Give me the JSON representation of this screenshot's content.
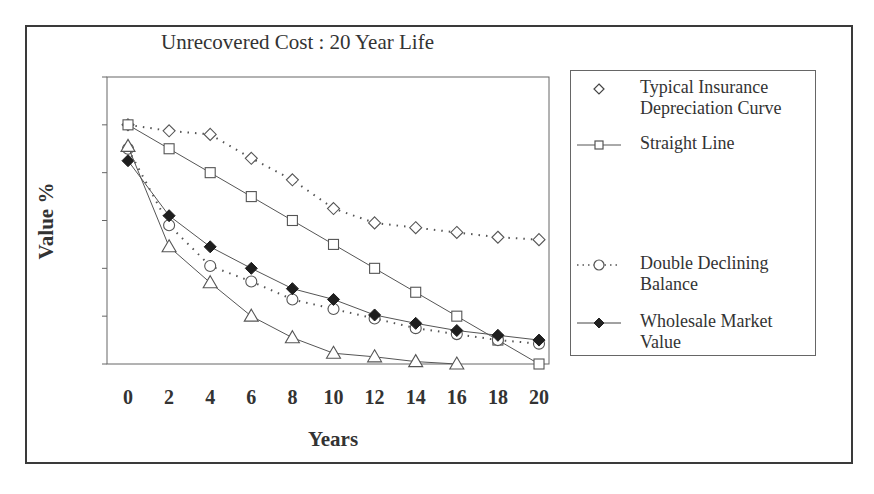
{
  "chart_data": {
    "type": "line",
    "title": "Unrecovered Cost : 20 Year Life",
    "xlabel": "Years",
    "ylabel": "Value %",
    "x": [
      0,
      2,
      4,
      6,
      8,
      10,
      12,
      14,
      16,
      18,
      20
    ],
    "xticks": [
      "0",
      "2",
      "4",
      "6",
      "8",
      "10",
      "12",
      "14",
      "16",
      "18",
      "20"
    ],
    "ylim": [
      0,
      120
    ],
    "ytick_count": 7,
    "ytick_labels_visible": false,
    "grid": false,
    "legend_position": "right",
    "series": [
      {
        "name": "Typical Insurance Depreciation Curve",
        "marker": "open-diamond",
        "line": "dotted",
        "values": [
          100,
          97.5,
          96,
          86,
          77,
          65,
          59,
          57,
          55,
          53,
          52
        ]
      },
      {
        "name": "Straight Line",
        "marker": "open-square",
        "line": "solid",
        "values": [
          100,
          90,
          80,
          70,
          60,
          50,
          40,
          30,
          20,
          10,
          0
        ]
      },
      {
        "name": "Double Declining Balance",
        "marker": "open-circle",
        "line": "dotted",
        "values": [
          90,
          58,
          41,
          34.5,
          27,
          23,
          19,
          15,
          12.5,
          10,
          8.5
        ]
      },
      {
        "name": "Wholesale Market Value",
        "marker": "filled-diamond",
        "line": "solid",
        "values": [
          85,
          62,
          49,
          40,
          31.5,
          27,
          20.5,
          17,
          14,
          12,
          10
        ]
      },
      {
        "name": "",
        "marker": "open-triangle",
        "line": "solid",
        "legend": false,
        "values": [
          91,
          49,
          34,
          20,
          11,
          4.5,
          3,
          1,
          0,
          null,
          null
        ]
      }
    ]
  },
  "legend": {
    "items": [
      {
        "label": "Typical Insurance Depreciation Curve",
        "icon": "open-diamond-icon"
      },
      {
        "label": "Straight Line",
        "icon": "open-square-line-icon"
      },
      {
        "label": "Double Declining Balance",
        "icon": "open-circle-dotted-icon"
      },
      {
        "label": "Wholesale Market Value",
        "icon": "filled-diamond-line-icon"
      }
    ]
  },
  "colors": {
    "ink": "#333333",
    "frame": "#3a3a3a",
    "background": "#ffffff"
  }
}
